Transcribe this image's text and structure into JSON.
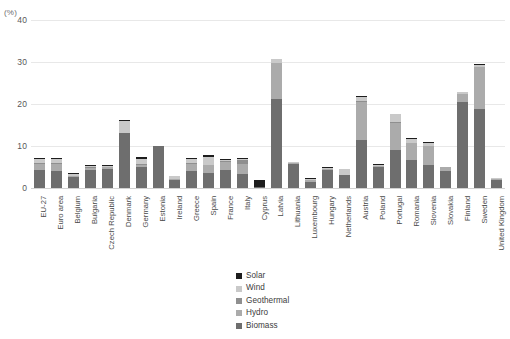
{
  "axis_unit_label": "(%)",
  "colors": {
    "solar": "#1d1d1d",
    "wind": "#c9c9c9",
    "geothermal": "#8f8f8f",
    "hydro": "#ababab",
    "biomass": "#6e6e6e",
    "gridline": "#e8e8e8",
    "axis": "#d2d2d2",
    "text": "#3c3c3c"
  },
  "legend": {
    "position": "bottom-center",
    "items": [
      {
        "label": "Solar",
        "color": "#1d1d1d",
        "key": "solar"
      },
      {
        "label": "Wind",
        "color": "#c9c9c9",
        "key": "wind"
      },
      {
        "label": "Geothermal",
        "color": "#8f8f8f",
        "key": "geothermal"
      },
      {
        "label": "Hydro",
        "color": "#ababab",
        "key": "hydro"
      },
      {
        "label": "Biomass",
        "color": "#6e6e6e",
        "key": "biomass"
      }
    ]
  },
  "chart_data": {
    "type": "bar",
    "subtype": "stacked-vertical",
    "title": "",
    "subtitle": "",
    "xlabel": "",
    "ylabel": "(%)",
    "ylim": [
      0,
      40
    ],
    "yticks": [
      0,
      10,
      20,
      30,
      40
    ],
    "ytick_labels": [
      "0",
      "10",
      "20",
      "30",
      "40"
    ],
    "grid": true,
    "grid_axis": "y",
    "legend_entries": [
      "Solar",
      "Wind",
      "Geothermal",
      "Hydro",
      "Biomass"
    ],
    "categories": [
      "EU-27",
      "Euro area",
      "Belgium",
      "Bulgaria",
      "Czech Republic",
      "Denmark",
      "Germany",
      "Estonia",
      "Ireland",
      "Greece",
      "Spain",
      "France",
      "Italy",
      "Cyprus",
      "Latvia",
      "Lithuania",
      "Luxembourg",
      "Hungary",
      "Netherlands",
      "Austria",
      "Poland",
      "Portugal",
      "Romania",
      "Slovenia",
      "Slovakia",
      "Finland",
      "Sweden",
      "United Kingdom"
    ],
    "series": [
      {
        "name": "Biomass",
        "color": "#6e6e6e",
        "values": [
          4.3,
          4.1,
          2.6,
          4.4,
          4.5,
          13.0,
          5.0,
          9.9,
          1.8,
          4.1,
          3.5,
          4.4,
          3.3,
          0.2,
          21.2,
          5.6,
          1.4,
          4.2,
          3.0,
          11.5,
          5.0,
          9.0,
          6.6,
          5.4,
          4.0,
          20.5,
          18.7,
          1.9
        ]
      },
      {
        "name": "Hydro",
        "color": "#ababab",
        "values": [
          1.5,
          1.6,
          0.2,
          0.4,
          0.5,
          0.0,
          0.5,
          0.0,
          0.3,
          1.6,
          1.9,
          1.8,
          2.5,
          0.0,
          8.6,
          0.3,
          0.5,
          0.1,
          0.0,
          9.0,
          0.3,
          6.4,
          4.2,
          4.6,
          0.9,
          2.0,
          10.0,
          0.1
        ]
      },
      {
        "name": "Geothermal",
        "color": "#8f8f8f",
        "values": [
          0.1,
          0.1,
          0.0,
          0.2,
          0.0,
          0.1,
          0.1,
          0.0,
          0.0,
          0.1,
          0.0,
          0.1,
          0.8,
          0.0,
          0.0,
          0.0,
          0.0,
          0.1,
          0.1,
          0.1,
          0.0,
          0.1,
          0.0,
          0.0,
          0.0,
          0.0,
          0.0,
          0.0
        ]
      },
      {
        "name": "Wind",
        "color": "#c9c9c9",
        "values": [
          1.0,
          1.0,
          0.5,
          0.2,
          0.2,
          2.8,
          1.2,
          0.1,
          0.7,
          1.0,
          1.9,
          0.3,
          0.4,
          0.0,
          1.0,
          0.3,
          0.3,
          0.2,
          1.2,
          1.0,
          0.3,
          1.9,
          0.9,
          0.8,
          0.0,
          0.3,
          0.6,
          0.2
        ]
      },
      {
        "name": "Solar",
        "color": "#1d1d1d",
        "values": [
          0.1,
          0.2,
          0.1,
          0.1,
          0.1,
          0.1,
          0.4,
          0.0,
          0.0,
          0.2,
          0.6,
          0.1,
          0.1,
          1.8,
          0.0,
          0.0,
          0.1,
          0.1,
          0.1,
          0.2,
          0.1,
          0.2,
          0.1,
          0.2,
          0.1,
          0.0,
          0.1,
          0.0
        ]
      }
    ],
    "totals": [
      7.0,
      7.0,
      3.4,
      5.3,
      5.3,
      16.0,
      7.2,
      10.0,
      2.8,
      7.0,
      7.9,
      6.7,
      7.1,
      2.0,
      30.8,
      6.2,
      2.3,
      4.7,
      4.4,
      21.8,
      5.7,
      17.6,
      11.8,
      11.0,
      5.0,
      22.8,
      29.4,
      2.2
    ]
  }
}
